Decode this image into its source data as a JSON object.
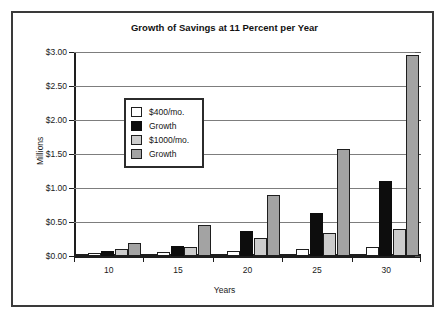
{
  "chart_data": {
    "type": "bar",
    "title": "Growth of Savings at 11 Percent per Year",
    "xlabel": "Years",
    "ylabel": "Millions",
    "categories": [
      "10",
      "15",
      "20",
      "25",
      "30"
    ],
    "series": [
      {
        "name": "$400/mo.",
        "color": "#ffffff",
        "values": [
          0.05,
          0.06,
          0.08,
          0.11,
          0.13
        ]
      },
      {
        "name": "Growth",
        "color": "#0d0d0d",
        "values": [
          0.08,
          0.14,
          0.37,
          0.63,
          1.1
        ]
      },
      {
        "name": "$1000/mo.",
        "color": "#cccccc",
        "values": [
          0.1,
          0.13,
          0.27,
          0.34,
          0.39
        ]
      },
      {
        "name": "Growth",
        "color": "#a3a3a3",
        "values": [
          0.19,
          0.46,
          0.89,
          1.57,
          2.96
        ]
      }
    ],
    "ylim": [
      0,
      3.0
    ],
    "ytick_values": [
      0,
      0.5,
      1.0,
      1.5,
      2.0,
      2.5,
      3.0
    ],
    "ytick_labels": [
      "$0.00",
      "$0.50",
      "$1.00",
      "$1.50",
      "$2.00",
      "$2.50",
      "$3.00"
    ],
    "grid": true,
    "legend_position": "inside-upper-left"
  }
}
